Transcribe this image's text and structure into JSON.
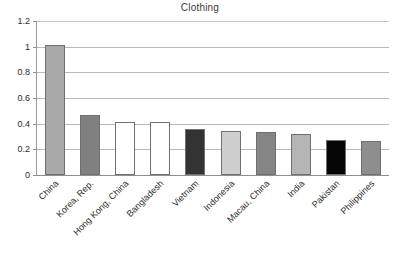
{
  "chart_data": {
    "type": "bar",
    "title": "Clothing",
    "xlabel": "",
    "ylabel": "",
    "ylim": [
      0,
      1.2
    ],
    "ytick_labels": [
      "0",
      "0.2",
      "0.4",
      "0.6",
      "0.8",
      "1",
      "1.2"
    ],
    "ytick_values": [
      0,
      0.2,
      0.4,
      0.6,
      0.8,
      1,
      1.2
    ],
    "grid": true,
    "legend": "none",
    "categories": [
      "China",
      "Korea, Rep.",
      "Hong Kong, China",
      "Bangladesh",
      "Vietnam",
      "Indonesia",
      "Macau, China",
      "India",
      "Pakistan",
      "Philippines"
    ],
    "values": [
      1.01,
      0.47,
      0.41,
      0.41,
      0.36,
      0.345,
      0.332,
      0.32,
      0.27,
      0.265
    ],
    "bar_colors": [
      "#a9a9a9",
      "#808080",
      "#ffffff",
      "#ffffff",
      "#333333",
      "#cfcfcf",
      "#858585",
      "#b5b5b5",
      "#050505",
      "#8e8e8e"
    ],
    "bar_border_color": "#707070",
    "axis_color": "#8f8f8f",
    "gridline_color": "#b9b9b9",
    "text_color": "#2c2c2c"
  }
}
